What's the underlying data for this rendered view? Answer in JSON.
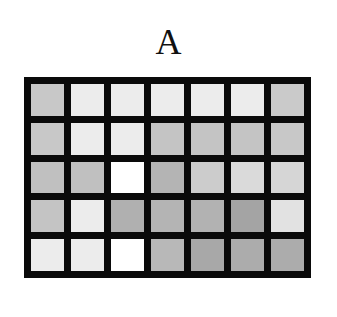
{
  "title": "A",
  "grid": {
    "rows": 5,
    "cols": 7,
    "border_color": "#0a0a0a",
    "cells": [
      [
        "#c8c8c8",
        "#ececec",
        "#ececec",
        "#ececec",
        "#ececec",
        "#ececec",
        "#cacaca"
      ],
      [
        "#c8c8c8",
        "#ececec",
        "#ececec",
        "#c4c4c4",
        "#c4c4c4",
        "#c4c4c4",
        "#c8c8c8"
      ],
      [
        "#c0c0c0",
        "#c0c0c0",
        "#ffffff",
        "#b4b4b4",
        "#cccccc",
        "#dadada",
        "#d6d6d6"
      ],
      [
        "#c4c4c4",
        "#ececec",
        "#b0b0b0",
        "#b4b4b4",
        "#b2b2b2",
        "#a4a4a4",
        "#e2e2e2"
      ],
      [
        "#ececec",
        "#ececec",
        "#ffffff",
        "#b8b8b8",
        "#a8a8a8",
        "#acacac",
        "#acacac"
      ]
    ]
  }
}
